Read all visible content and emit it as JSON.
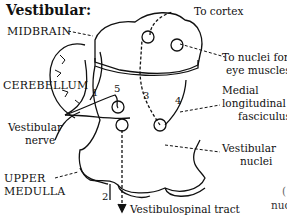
{
  "title": "Vestibular:",
  "regions": {
    "midbrain": "MIDBRAIN",
    "cerebellum": "CEREBELLUM",
    "upper_medulla_line1": "UPPER",
    "upper_medulla_line2": "MEDULLA"
  },
  "labels": {
    "to_cortex": "To cortex",
    "to_nuclei_line1": "To nuclei for",
    "to_nuclei_line2": "eye muscles",
    "mlf_line1": "Medial",
    "mlf_line2": "longitudinal",
    "mlf_line3": "fasciculus",
    "vestibular_nerve_line1": "Vestibular",
    "vestibular_nerve_line2": "nerve",
    "vestibular_nuclei_line1": "Vestibular",
    "vestibular_nuclei_line2": "nuclei",
    "vestibulospinal": "Vestibulospinal tract",
    "cut_off_paren": "(",
    "cut_off_nuc": "nuc"
  },
  "pathway_numbers": [
    "1",
    "2",
    "3",
    "4",
    "5"
  ]
}
